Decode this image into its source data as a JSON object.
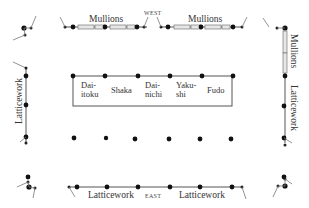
{
  "diagram": {
    "type": "temple floor plan",
    "orientation": {
      "top_label": "WEST",
      "bottom_label": "EAST"
    },
    "wall_labels": {
      "top_left": "Mullions",
      "top_right": "Mullions",
      "right_upper": "Mullions",
      "right_lower": "Latticework",
      "left": "Latticework",
      "bottom_left": "Latticework",
      "bottom_right": "Latticework"
    },
    "altar": {
      "figures": [
        {
          "line1": "Dai-",
          "line2": "itoku"
        },
        {
          "line1": "Shaka",
          "line2": ""
        },
        {
          "line1": "Dai-",
          "line2": "nichi"
        },
        {
          "line1": "Yaku-",
          "line2": "shi"
        },
        {
          "line1": "Fudo",
          "line2": ""
        }
      ]
    },
    "colors": {
      "ink": "#111111",
      "line": "#555555",
      "mullion_fill": "#e6e6e6",
      "text": "#333333"
    }
  }
}
